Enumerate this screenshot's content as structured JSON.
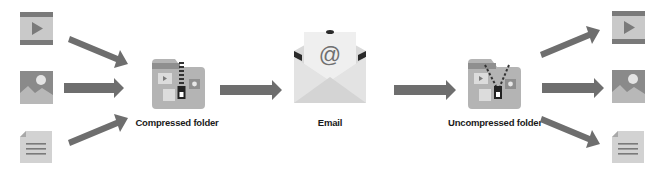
{
  "diagram": {
    "nodes": [
      {
        "id": "video-in",
        "icon": "video-file-icon"
      },
      {
        "id": "image-in",
        "icon": "image-file-icon"
      },
      {
        "id": "document-in",
        "icon": "document-file-icon"
      },
      {
        "id": "compressed",
        "icon": "zipped-folder-icon",
        "label": "Compressed folder"
      },
      {
        "id": "email",
        "icon": "email-envelope-icon",
        "label": "Email",
        "symbol": "@"
      },
      {
        "id": "uncompressed",
        "icon": "unzipped-folder-icon",
        "label": "Uncompressed folder"
      },
      {
        "id": "video-out",
        "icon": "video-file-icon"
      },
      {
        "id": "image-out",
        "icon": "image-file-icon"
      },
      {
        "id": "document-out",
        "icon": "document-file-icon"
      }
    ],
    "edges": [
      {
        "from": "video-in",
        "to": "compressed"
      },
      {
        "from": "image-in",
        "to": "compressed"
      },
      {
        "from": "document-in",
        "to": "compressed"
      },
      {
        "from": "compressed",
        "to": "email"
      },
      {
        "from": "email",
        "to": "uncompressed"
      },
      {
        "from": "uncompressed",
        "to": "video-out"
      },
      {
        "from": "uncompressed",
        "to": "image-out"
      },
      {
        "from": "uncompressed",
        "to": "document-out"
      }
    ]
  },
  "labels": {
    "compressed": "Compressed folder",
    "email": "Email",
    "email_symbol": "@",
    "uncompressed": "Uncompressed folder"
  },
  "colors": {
    "arrow": "#6e6e6e",
    "icon_dark": "#7a7a7a",
    "icon_light": "#c8c8c8",
    "folder_body": "#b4b4b4",
    "envelope_light": "#e6e6e6",
    "envelope_dark": "#2a2a2a"
  }
}
